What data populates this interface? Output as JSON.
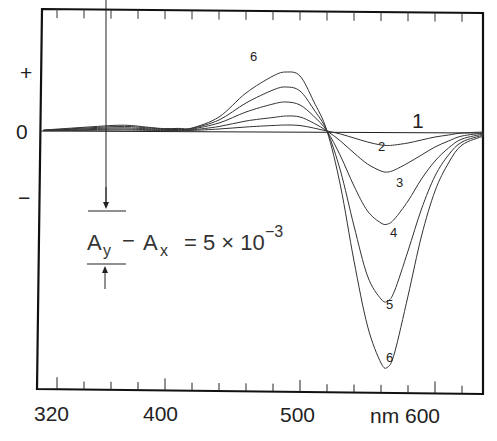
{
  "chart_data": {
    "type": "line",
    "title": "",
    "xlabel": "nm",
    "ylabel": "",
    "xlim": [
      308,
      636
    ],
    "ylim_relative": [
      "-",
      "0",
      "+"
    ],
    "x_ticks": [
      320,
      400,
      500,
      600
    ],
    "x_tick_labels": [
      "320",
      "400",
      "500",
      "nm 600"
    ],
    "x_minor_tick_step": 20,
    "y_tick_labels": [
      "+",
      "0",
      "−"
    ],
    "grid": false,
    "legend": "inline curve numbers 1–6",
    "scale_bar": {
      "label": "Ay − Ax = 5 × 10⁻³",
      "lhs_a1": "A",
      "lhs_s1": "y",
      "minus": "−",
      "lhs_a2": "A",
      "lhs_s2": "x",
      "rhs": "= 5 × 10",
      "exponent": "−3"
    },
    "annotations": [
      {
        "text": "1",
        "x": 590,
        "curve": 1
      },
      {
        "text": "2",
        "x": 568,
        "curve": 2
      },
      {
        "text": "3",
        "x": 577,
        "curve": 3
      },
      {
        "text": "4",
        "x": 572,
        "curve": 4
      },
      {
        "text": "5",
        "x": 566,
        "curve": 5
      },
      {
        "text": "6",
        "x": 566,
        "curve": 6
      },
      {
        "text": "6",
        "x": 478,
        "curve": 6
      }
    ],
    "x": [
      310,
      330,
      350,
      370,
      390,
      400,
      410,
      420,
      440,
      460,
      480,
      490,
      500,
      510,
      520,
      530,
      540,
      550,
      560,
      565,
      570,
      580,
      590,
      600,
      610,
      620,
      636
    ],
    "series": [
      {
        "name": "1",
        "values": [
          0,
          0,
          0,
          0,
          0,
          0,
          0,
          0,
          0,
          0,
          0,
          0,
          0,
          0,
          0,
          0,
          0,
          0,
          0,
          0,
          0,
          0,
          0,
          0,
          0,
          0,
          0
        ]
      },
      {
        "name": "2",
        "values": [
          0.2,
          0.5,
          0.8,
          1.0,
          0.6,
          0.4,
          0.5,
          0.6,
          2.0,
          4.0,
          5.5,
          6.0,
          5.5,
          3.0,
          0,
          -3,
          -7,
          -11,
          -14,
          -14.5,
          -14,
          -12,
          -9,
          -6,
          -4,
          -2,
          -1
        ]
      },
      {
        "name": "3",
        "values": [
          0.4,
          1.0,
          1.6,
          2.0,
          1.2,
          0.8,
          1.0,
          1.2,
          4.5,
          10,
          13.5,
          15,
          14,
          8,
          0,
          -10,
          -22,
          -33,
          -40,
          -41,
          -39,
          -32,
          -24,
          -16,
          -10,
          -5,
          -2
        ]
      },
      {
        "name": "4",
        "values": [
          0.6,
          1.6,
          2.6,
          3.2,
          2.0,
          1.4,
          1.6,
          2.0,
          8,
          19,
          27,
          29,
          26,
          15,
          0,
          -25,
          -55,
          -80,
          -92,
          -93,
          -88,
          -70,
          -48,
          -30,
          -17,
          -8,
          -3
        ]
      },
      {
        "name": "5",
        "values": [
          0.8,
          2.2,
          3.6,
          4.6,
          2.8,
          2.0,
          2.2,
          2.6,
          11,
          28,
          41,
          44,
          40,
          22,
          0,
          -40,
          -95,
          -145,
          -168,
          -170,
          -160,
          -120,
          -78,
          -45,
          -24,
          -11,
          -4
        ]
      },
      {
        "name": "6",
        "values": [
          1.0,
          2.8,
          4.6,
          5.8,
          3.4,
          2.4,
          2.6,
          3.0,
          14,
          38,
          55,
          59,
          55,
          30,
          0,
          -55,
          -130,
          -195,
          -232,
          -236,
          -222,
          -165,
          -105,
          -60,
          -32,
          -14,
          -5
        ]
      }
    ]
  }
}
